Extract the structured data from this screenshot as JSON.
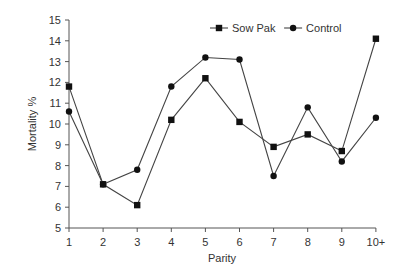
{
  "chart_data": {
    "type": "line",
    "title": "",
    "xlabel": "Parity",
    "ylabel": "Mortality %",
    "categories": [
      "1",
      "2",
      "3",
      "4",
      "5",
      "6",
      "7",
      "8",
      "9",
      "10+"
    ],
    "ylim": [
      5,
      15
    ],
    "yticks": [
      5,
      6,
      7,
      8,
      9,
      10,
      11,
      12,
      13,
      14,
      15
    ],
    "grid": false,
    "legend_position": "top-right",
    "series": [
      {
        "name": "Sow Pak",
        "marker": "square",
        "values": [
          11.8,
          7.1,
          6.1,
          10.2,
          12.2,
          10.1,
          8.9,
          9.5,
          8.7,
          14.1
        ]
      },
      {
        "name": "Control",
        "marker": "circle",
        "values": [
          10.6,
          7.1,
          7.8,
          11.8,
          13.2,
          13.1,
          7.5,
          10.8,
          8.2,
          10.3
        ]
      }
    ]
  },
  "colors": {
    "line": "#444444",
    "marker": "#111111",
    "axis": "#555555",
    "text": "#333333"
  }
}
